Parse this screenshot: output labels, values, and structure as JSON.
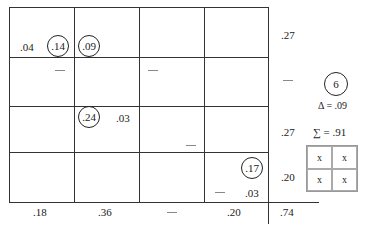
{
  "grid": {
    "cells": {
      "r0c0": ".04",
      "r0c1_circled": ".14",
      "r0c1b_circled": ".09",
      "r2c1_circled": ".24",
      "r2c1b": ".03",
      "r3c3_circled": ".17",
      "r3c3b": ".03"
    },
    "dash": "—"
  },
  "row_totals": [
    ".27",
    "—",
    ".27",
    ".20"
  ],
  "col_totals": [
    ".18",
    ".36",
    "—",
    ".20"
  ],
  "grand_total": ".74",
  "annotation": {
    "circled_number": "6",
    "delta": "Δ = .09",
    "sum": "∑ = .91",
    "mini_grid": [
      "x",
      "x",
      "x",
      "x"
    ]
  }
}
